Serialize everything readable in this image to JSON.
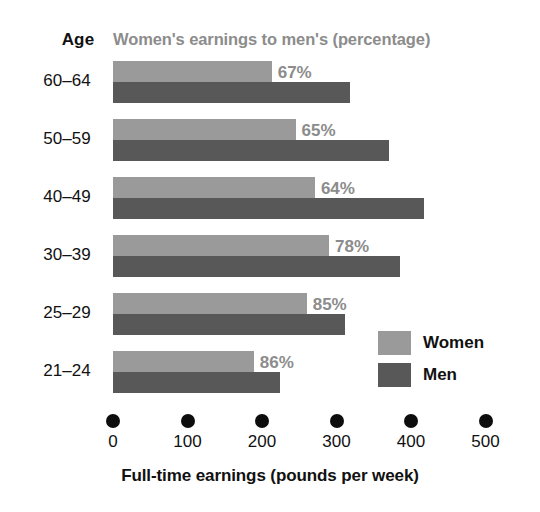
{
  "header": {
    "age_heading": "Age",
    "title": "Women's earnings to men's (percentage)"
  },
  "chart_data": {
    "type": "bar",
    "orientation": "horizontal",
    "title": "Women's earnings to men's (percentage)",
    "xlabel": "Full-time earnings (pounds per week)",
    "ylabel": "Age",
    "xlim": [
      0,
      500
    ],
    "xticks": [
      0,
      100,
      200,
      300,
      400,
      500
    ],
    "xticklabels": [
      "0",
      "100",
      "200",
      "300",
      "400",
      "500"
    ],
    "grid": false,
    "legend_position": "inside-right",
    "categories": [
      "60–64",
      "50–59",
      "40–49",
      "30–39",
      "25–29",
      "21–24"
    ],
    "series": [
      {
        "name": "Women",
        "color": "#9a9a9a",
        "values": [
          213,
          245,
          271,
          290,
          260,
          189
        ]
      },
      {
        "name": "Men",
        "color": "#585858",
        "values": [
          318,
          370,
          417,
          385,
          311,
          224
        ]
      }
    ],
    "annotations": [
      "67%",
      "65%",
      "64%",
      "78%",
      "85%",
      "86%"
    ],
    "ratios_percent": [
      67,
      65,
      64,
      78,
      85,
      86
    ]
  },
  "legend": {
    "items": [
      {
        "label": "Women",
        "color": "#9a9a9a"
      },
      {
        "label": "Men",
        "color": "#585858"
      }
    ]
  },
  "axis": {
    "title": "Full-time earnings (pounds per week)",
    "ticks": [
      "0",
      "100",
      "200",
      "300",
      "400",
      "500"
    ]
  },
  "colors": {
    "women": "#9a9a9a",
    "men": "#585858",
    "title_gray": "#8c8c8c",
    "text_black": "#111111",
    "background": "#ffffff"
  }
}
